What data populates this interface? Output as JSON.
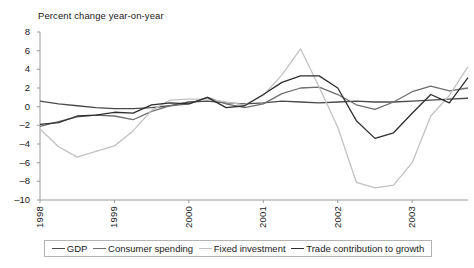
{
  "chart_data": {
    "type": "line",
    "title": "Percent change year-on-year",
    "xlabel": "",
    "ylabel": "Percent change year-on-year",
    "ylim": [
      -10,
      8
    ],
    "ytick_values": [
      8,
      6,
      4,
      2,
      0,
      -2,
      -4,
      -6,
      -8,
      -10
    ],
    "ytick_labels": [
      "8",
      "6",
      "4",
      "2",
      "0",
      "–2",
      "–4",
      "–6",
      "–8",
      "–10"
    ],
    "xtick_labels": [
      "1998",
      "1999",
      "2000",
      "2001",
      "2002",
      "2003"
    ],
    "xtick_positions": [
      0,
      4,
      8,
      12,
      16,
      20
    ],
    "x": [
      0,
      1,
      2,
      3,
      4,
      5,
      6,
      7,
      8,
      9,
      10,
      11,
      12,
      13,
      14,
      15,
      16,
      17,
      18,
      19,
      20,
      21,
      22,
      23
    ],
    "grid": false,
    "legend_position": "bottom",
    "series": [
      {
        "name": "GDP",
        "color": "#4a4a4a",
        "values": [
          0.6,
          0.3,
          0.1,
          -0.1,
          -0.2,
          -0.2,
          -0.1,
          0.1,
          0.5,
          0.6,
          0.4,
          0.3,
          0.4,
          0.6,
          0.5,
          0.4,
          0.5,
          0.6,
          0.5,
          0.5,
          0.6,
          0.7,
          0.8,
          0.9
        ]
      },
      {
        "name": "Consumer spending",
        "color": "#6e6e6e",
        "values": [
          -2.1,
          -1.6,
          -1.1,
          -0.9,
          -1.0,
          -1.4,
          -0.5,
          0.1,
          0.3,
          1.0,
          0.3,
          -0.1,
          0.3,
          1.4,
          2.0,
          2.1,
          1.3,
          0.2,
          -0.3,
          0.5,
          1.6,
          2.2,
          1.7,
          2.0
        ]
      },
      {
        "name": "Fixed investment",
        "color": "#c2c2c2",
        "values": [
          -2.4,
          -4.3,
          -5.4,
          -4.8,
          -4.2,
          -2.6,
          -0.4,
          0.7,
          0.8,
          0.8,
          0.5,
          0.2,
          1.2,
          3.4,
          6.2,
          2.1,
          -2.2,
          -8.1,
          -8.7,
          -8.4,
          -6.0,
          -1.0,
          1.2,
          4.3
        ]
      },
      {
        "name": "Trade contribution to growth",
        "color": "#2e2e2e",
        "values": [
          -1.9,
          -1.7,
          -1.0,
          -0.9,
          -0.6,
          -0.7,
          0.2,
          0.4,
          0.3,
          1.0,
          -0.1,
          0.1,
          1.3,
          2.6,
          3.3,
          3.3,
          2.0,
          -1.5,
          -3.4,
          -2.8,
          -0.7,
          1.3,
          0.4,
          3.1
        ]
      }
    ]
  }
}
